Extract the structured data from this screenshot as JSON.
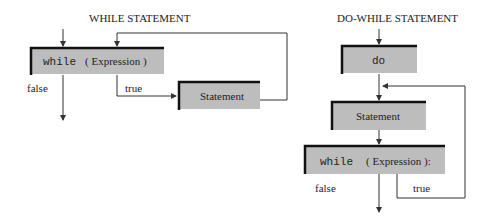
{
  "while_diagram": {
    "title": "WHILE STATEMENT",
    "condition_keyword": "while",
    "condition_expr": "( Expression )",
    "statement_label": "Statement",
    "false_label": "false",
    "true_label": "true"
  },
  "do_while_diagram": {
    "title": "DO-WHILE STATEMENT",
    "do_label": "do",
    "statement_label": "Statement",
    "condition_keyword": "while",
    "condition_expr": "( Expression ):",
    "false_label": "false",
    "true_label": "true"
  },
  "colors": {
    "box_fill": "#bdbdbd",
    "box_edge": "#111111",
    "line": "#333333"
  }
}
